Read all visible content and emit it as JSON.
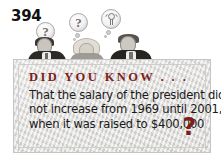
{
  "page": {
    "number": "394"
  },
  "illustration": {
    "bubbles": [
      {
        "name": "question-bubble-left",
        "glyph": "?"
      },
      {
        "name": "question-bubble-middle",
        "glyph": "?"
      },
      {
        "name": "lightbulb-bubble-right",
        "glyph": ""
      }
    ],
    "people": [
      {
        "name": "person-left"
      },
      {
        "name": "person-middle"
      },
      {
        "name": "person-right"
      }
    ]
  },
  "fact_box": {
    "heading": "DID YOU KNOW . . .",
    "body_lines": [
      "That the salary of the president did",
      "not increase from 1969 until 2001,",
      "when it was raised to $400,000"
    ],
    "trailing_mark": "?"
  },
  "colors": {
    "heading_red": "#7d1f1b",
    "box_background": "#dedddb",
    "box_border": "#c6c5c3",
    "body_text": "#1a1a1a",
    "page_number": "#111111"
  }
}
